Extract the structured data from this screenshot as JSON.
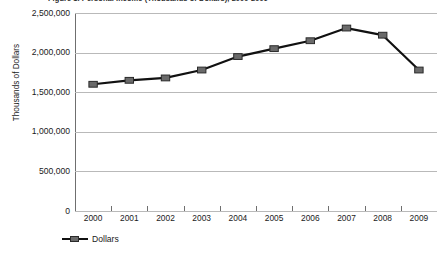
{
  "chart_data": {
    "type": "line",
    "title": "Figure 1. Personal Income (Thousands of Dollars), 2000-2009",
    "xlabel": "",
    "ylabel": "Thousands of Dollars",
    "categories": [
      "2000",
      "2001",
      "2002",
      "2003",
      "2004",
      "2005",
      "2006",
      "2007",
      "2008",
      "2009"
    ],
    "series": [
      {
        "name": "Dollars",
        "values": [
          1600000,
          1650000,
          1680000,
          1780000,
          1950000,
          2050000,
          2150000,
          2310000,
          2220000,
          1780000
        ]
      }
    ],
    "ylim": [
      0,
      2500000
    ],
    "y_ticks": [
      0,
      500000,
      1000000,
      1500000,
      2000000,
      2500000
    ],
    "y_tick_labels": [
      "0",
      "500,000",
      "1,000,000",
      "1,500,000",
      "2,000,000",
      "2,500,000"
    ],
    "grid": true,
    "legend_position": "bottom-left",
    "colors": {
      "line": "#111111",
      "marker_fill": "#6a6a6a",
      "marker_edge": "#2a2a2a",
      "gridline": "#b9b9b9",
      "axis": "#6f6f6f"
    }
  },
  "legend": {
    "entries": [
      {
        "label": "Dollars"
      }
    ]
  }
}
